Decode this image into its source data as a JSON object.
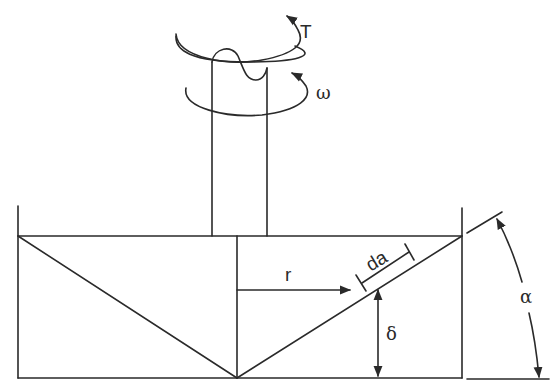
{
  "diagram": {
    "type": "cone-and-plate viscometer schematic",
    "colors": {
      "stroke": "#2a2a2a",
      "background": "#ffffff"
    },
    "labels": {
      "torque": "T",
      "angular_velocity": "ω",
      "radius": "r",
      "area_element": "da",
      "gap": "δ",
      "cone_angle": "α"
    },
    "components": [
      "rotating shaft",
      "torque arrow",
      "angular velocity arrow",
      "container walls",
      "cone",
      "radius arrow",
      "area element marker",
      "gap dimension arrow",
      "cone angle dimension arc"
    ]
  }
}
